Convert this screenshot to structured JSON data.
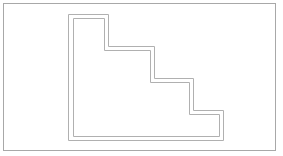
{
  "diagram": {
    "title": "",
    "shape": "staircase",
    "steps": 3,
    "outline_style": "double-line",
    "colors": {
      "background": "#ffffff",
      "frame": "#a8a8a8",
      "outline": "#b0b0b0"
    }
  }
}
